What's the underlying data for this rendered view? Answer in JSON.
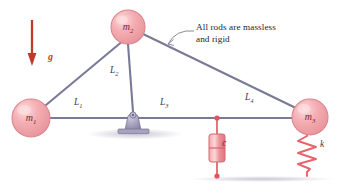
{
  "figure": {
    "type": "mechanical-schematic",
    "annotation": "All rods are massless\nand rigid",
    "gravity_label": "g",
    "masses": [
      {
        "id": "m1",
        "label": "m",
        "sub": "1",
        "cx": 31,
        "cy": 118,
        "r": 19
      },
      {
        "id": "m2",
        "label": "m",
        "sub": "2",
        "cx": 128,
        "cy": 27,
        "r": 17
      },
      {
        "id": "m3",
        "label": "m",
        "sub": "3",
        "cx": 310,
        "cy": 117,
        "r": 18
      }
    ],
    "rod_labels": [
      {
        "id": "L1",
        "label": "L",
        "sub": "1"
      },
      {
        "id": "L2",
        "label": "L",
        "sub": "2"
      },
      {
        "id": "L3",
        "label": "L",
        "sub": "3"
      },
      {
        "id": "L4",
        "label": "L",
        "sub": "4"
      }
    ],
    "damper_label": "c",
    "spring_label": "k",
    "colors": {
      "rod": "#7b7a96",
      "mass_fill": "#f3a3a8",
      "mass_stroke": "#d4868f",
      "spring": "#e8636b",
      "damper": "#e8737b",
      "gravity": "#c0392b",
      "ground": "#8d8da5",
      "pivot": "#9a96b4",
      "text": "#23232f"
    }
  }
}
